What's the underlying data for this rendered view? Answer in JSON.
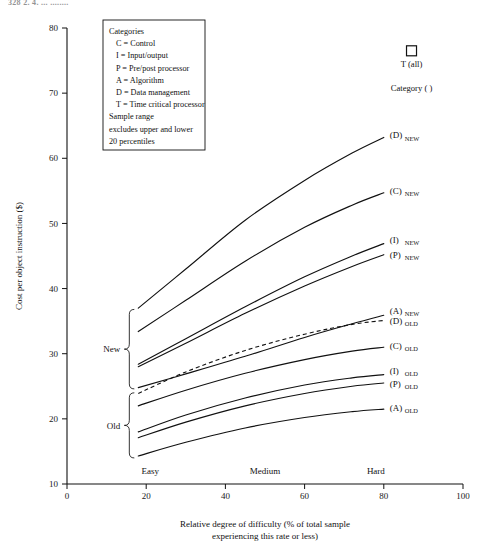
{
  "page": {
    "header_text": "328  2. 4. ... ........"
  },
  "chart_data": {
    "type": "line",
    "title": "",
    "xlabel": "Relative degree of difficulty (% of total sample experiencing this rate or less)",
    "xlabel_line1": "Relative degree of difficulty (% of total sample",
    "xlabel_line2": "experiencing this rate or less)",
    "ylabel": "Cost per object instruction ($)",
    "xlim": [
      0,
      100
    ],
    "ylim": [
      10,
      80
    ],
    "xticks": [
      0,
      20,
      40,
      60,
      80,
      100
    ],
    "xtick_labels": [
      "0",
      "20",
      "40",
      "60",
      "80",
      "100"
    ],
    "yticks": [
      10,
      20,
      30,
      40,
      50,
      60,
      70,
      80
    ],
    "ytick_labels": [
      "10",
      "20",
      "30",
      "40",
      "50",
      "60",
      "70",
      "80"
    ],
    "grid": false,
    "legend_position": "upper-left-inset",
    "difficulty_bands": [
      {
        "label": "Easy",
        "x": 21
      },
      {
        "label": "Medium",
        "x": 50
      },
      {
        "label": "Hard",
        "x": 78
      }
    ],
    "group_brackets": [
      {
        "label": "New",
        "y_top": 36.8,
        "y_bottom": 24.6
      },
      {
        "label": "Old",
        "y_top": 24.0,
        "y_bottom": 14.0
      }
    ],
    "marker": {
      "symbol": "square",
      "label": "T (all)",
      "caption": "Category ( )",
      "x": 87,
      "y": 76.5
    },
    "series": [
      {
        "name": "(D) NEW",
        "label_main": "(D)",
        "label_sub": "NEW",
        "style": "solid",
        "points": [
          [
            18.0,
            37.0
          ],
          [
            30.0,
            43.0
          ],
          [
            45.0,
            50.5
          ],
          [
            60.0,
            56.6
          ],
          [
            72.0,
            60.8
          ],
          [
            80.0,
            63.2
          ]
        ]
      },
      {
        "name": "(C) NEW",
        "label_main": "(C)",
        "label_sub": "NEW",
        "style": "solid",
        "points": [
          [
            18.0,
            33.4
          ],
          [
            30.0,
            38.2
          ],
          [
            45.0,
            44.2
          ],
          [
            60.0,
            49.4
          ],
          [
            72.0,
            52.8
          ],
          [
            80.0,
            54.7
          ]
        ]
      },
      {
        "name": "(I) NEW",
        "label_main": "(I)",
        "label_sub": "NEW",
        "style": "solid",
        "points": [
          [
            18.0,
            28.4
          ],
          [
            30.0,
            32.3
          ],
          [
            45.0,
            37.2
          ],
          [
            60.0,
            41.8
          ],
          [
            72.0,
            45.0
          ],
          [
            80.0,
            46.9
          ]
        ]
      },
      {
        "name": "(P) NEW",
        "label_main": "(P)",
        "label_sub": "NEW",
        "style": "solid",
        "points": [
          [
            18.0,
            28.0
          ],
          [
            30.0,
            31.6
          ],
          [
            45.0,
            36.2
          ],
          [
            60.0,
            40.4
          ],
          [
            72.0,
            43.4
          ],
          [
            80.0,
            45.2
          ]
        ]
      },
      {
        "name": "(A) NEW",
        "label_main": "(A)",
        "label_sub": "NEW",
        "style": "solid",
        "points": [
          [
            18.0,
            24.8
          ],
          [
            30.0,
            26.9
          ],
          [
            45.0,
            29.6
          ],
          [
            60.0,
            32.5
          ],
          [
            72.0,
            34.6
          ],
          [
            80.0,
            35.9
          ]
        ]
      },
      {
        "name": "(D) OLD",
        "label_main": "(D)",
        "label_sub": "OLD",
        "style": "dashed",
        "points": [
          [
            18.0,
            23.9
          ],
          [
            30.0,
            27.2
          ],
          [
            45.0,
            30.5
          ],
          [
            60.0,
            33.0
          ],
          [
            72.0,
            34.5
          ],
          [
            80.0,
            35.1
          ]
        ]
      },
      {
        "name": "(C) OLD",
        "label_main": "(C)",
        "label_sub": "OLD",
        "style": "solid",
        "points": [
          [
            18.0,
            22.0
          ],
          [
            30.0,
            24.4
          ],
          [
            45.0,
            27.0
          ],
          [
            60.0,
            29.1
          ],
          [
            72.0,
            30.4
          ],
          [
            80.0,
            31.0
          ]
        ]
      },
      {
        "name": "(I) OLD",
        "label_main": "(I)",
        "label_sub": "OLD",
        "style": "solid",
        "points": [
          [
            18.0,
            18.0
          ],
          [
            30.0,
            20.6
          ],
          [
            45.0,
            23.2
          ],
          [
            60.0,
            25.2
          ],
          [
            72.0,
            26.3
          ],
          [
            80.0,
            26.8
          ]
        ]
      },
      {
        "name": "(P) OLD",
        "label_main": "(P)",
        "label_sub": "OLD",
        "style": "solid",
        "points": [
          [
            18.0,
            17.1
          ],
          [
            30.0,
            19.5
          ],
          [
            45.0,
            22.0
          ],
          [
            60.0,
            23.9
          ],
          [
            72.0,
            25.0
          ],
          [
            80.0,
            25.5
          ]
        ]
      },
      {
        "name": "(A) OLD",
        "label_main": "(A)",
        "label_sub": "OLD",
        "style": "solid",
        "points": [
          [
            18.0,
            14.3
          ],
          [
            30.0,
            16.4
          ],
          [
            45.0,
            18.6
          ],
          [
            60.0,
            20.2
          ],
          [
            72.0,
            21.1
          ],
          [
            80.0,
            21.5
          ]
        ]
      }
    ],
    "annotations": [
      "Categories",
      "C = Control",
      "I = Input/output",
      "P = Pre/post processor",
      "A = Algorithm",
      "D = Data management",
      "T = Time critical processor",
      "Sample range",
      "excludes upper and lower",
      "20 percentiles"
    ]
  },
  "legend_box": {
    "lines": [
      {
        "text": "Categories",
        "indent": 0
      },
      {
        "text": "C = Control",
        "indent": 1
      },
      {
        "text": "I = Input/output",
        "indent": 1
      },
      {
        "text": "P = Pre/post processor",
        "indent": 1
      },
      {
        "text": "A = Algorithm",
        "indent": 1
      },
      {
        "text": "D = Data management",
        "indent": 1
      },
      {
        "text": "T = Time critical processor",
        "indent": 1
      },
      {
        "text": "Sample range",
        "indent": 0
      },
      {
        "text": "excludes upper and lower",
        "indent": 0
      },
      {
        "text": "20 percentiles",
        "indent": 0
      }
    ]
  },
  "colors": {
    "ink": "#111111",
    "background": "#ffffff"
  }
}
